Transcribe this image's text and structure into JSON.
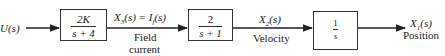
{
  "diagram": {
    "type": "block-diagram",
    "input": {
      "label": "U(s)"
    },
    "blocks": [
      {
        "id": "b1",
        "numerator": "2K",
        "denominator": "s + 4"
      },
      {
        "id": "b2",
        "numerator": "2",
        "denominator": "s + 1"
      },
      {
        "id": "b3",
        "numerator": "1",
        "denominator": "s"
      }
    ],
    "signals": [
      {
        "between": "b1-b2",
        "label": "X3(s) = If(s)",
        "label_parts": {
          "x": "X",
          "xsub": "3",
          "s1": "(s) = ",
          "i": "I",
          "isub": "f",
          "s2": "(s)"
        },
        "caption_line1": "Field",
        "caption_line2": "current"
      },
      {
        "between": "b2-b3",
        "label": "X2(s)",
        "label_parts": {
          "x": "X",
          "xsub": "2",
          "s": "(s)"
        },
        "caption": "Velocity"
      },
      {
        "between": "b3-out",
        "label": "X1(s)",
        "label_parts": {
          "x": "X",
          "xsub": "1",
          "s": "(s)"
        },
        "caption": "Position"
      }
    ]
  },
  "colors": {
    "line": "#333333",
    "text": "#1a1a1a",
    "background": "#ffffff"
  }
}
